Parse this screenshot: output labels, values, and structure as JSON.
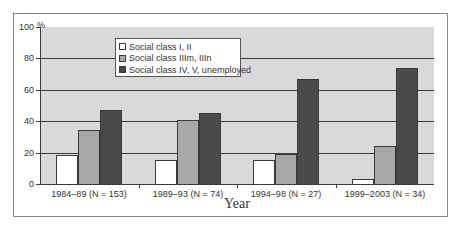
{
  "chart_data": {
    "type": "bar",
    "title": "",
    "xlabel": "Year",
    "ylabel": "%",
    "ylim": [
      0,
      100
    ],
    "yticks": [
      0,
      20,
      40,
      60,
      80,
      100
    ],
    "grid": true,
    "legend_position": "top-left inside",
    "categories": [
      "1984–89 (N = 153)",
      "1989–93 (N = 74)",
      "1994–98 (N = 27)",
      "1999–2003 (N = 34)"
    ],
    "series": [
      {
        "name": "Social class I, II",
        "color": "#ffffff",
        "values": [
          18.5,
          15,
          15,
          3
        ]
      },
      {
        "name": "Social class IIIm, IIIn",
        "color": "#a8a8a8",
        "values": [
          34.5,
          41,
          19,
          24
        ]
      },
      {
        "name": "Social class IV, V, unemployed",
        "color": "#4a4a4a",
        "values": [
          47,
          45,
          67,
          74
        ]
      }
    ]
  },
  "axis": {
    "y_unit": "%",
    "y_tick_labels": [
      "0",
      "20",
      "40",
      "60",
      "80",
      "100"
    ],
    "x_title": "Year"
  },
  "legend": {
    "items": [
      "Social class I, II",
      "Social class IIIm, IIIn",
      "Social class IV, V, unemployed"
    ]
  }
}
